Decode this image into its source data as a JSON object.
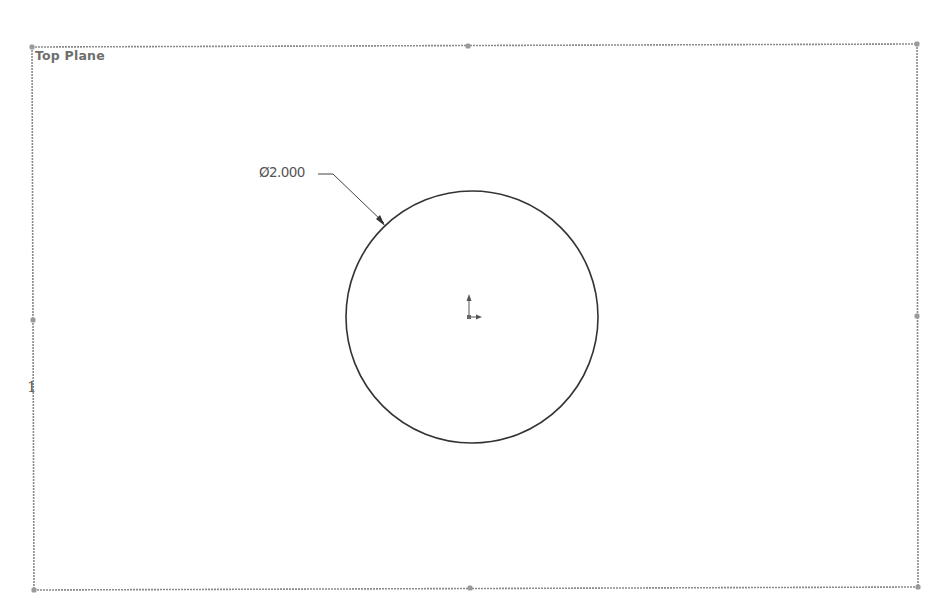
{
  "viewport": {
    "background": "#ffffff",
    "width": 936,
    "height": 602
  },
  "plane": {
    "label": "Top Plane",
    "frame_color": "#8a8a8a",
    "corners": {
      "top_left": [
        32,
        47
      ],
      "top_right": [
        917,
        44
      ],
      "bottom_right": [
        918,
        587
      ],
      "bottom_left": [
        34,
        590
      ]
    },
    "handles": [
      {
        "name": "top-left",
        "x": 32,
        "y": 47
      },
      {
        "name": "top-mid",
        "x": 468,
        "y": 46
      },
      {
        "name": "top-right",
        "x": 917,
        "y": 44
      },
      {
        "name": "left-mid",
        "x": 33,
        "y": 320
      },
      {
        "name": "right-mid",
        "x": 917,
        "y": 316
      },
      {
        "name": "bottom-left",
        "x": 34,
        "y": 590
      },
      {
        "name": "bottom-mid",
        "x": 470,
        "y": 588
      },
      {
        "name": "bottom-right",
        "x": 918,
        "y": 587
      }
    ]
  },
  "sketch": {
    "circle": {
      "cx": 472,
      "cy": 317,
      "r": 126,
      "stroke": "#333333"
    },
    "origin": {
      "x": 469,
      "y": 317,
      "color": "#555555",
      "icon": "sketch-origin-icon"
    },
    "dimension": {
      "symbol": "Ø",
      "value": "2.000",
      "text": "Ø2.000",
      "leader_color": "#444444"
    }
  },
  "annotations": {
    "stray_mark": "1"
  }
}
